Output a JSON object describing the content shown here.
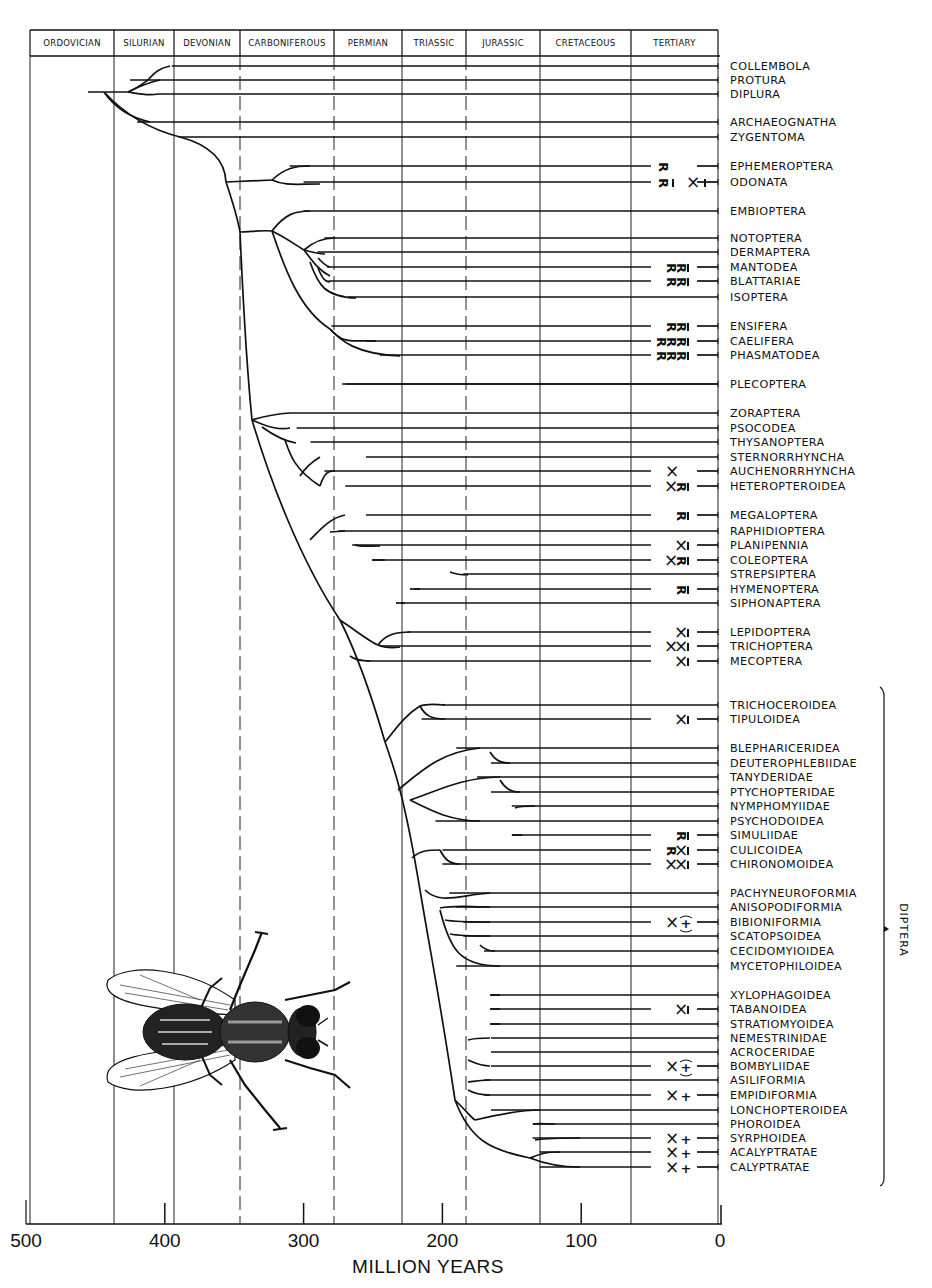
{
  "chart_data": {
    "type": "phylogenetic-tree",
    "title": "",
    "xlabel": "MILLION YEARS",
    "xlim": [
      500,
      0
    ],
    "x_ticks": [
      500,
      400,
      300,
      200,
      100,
      0
    ],
    "periods": [
      {
        "name": "ORDOVICIAN",
        "start": 500,
        "end": 440
      },
      {
        "name": "SILURIAN",
        "start": 440,
        "end": 395
      },
      {
        "name": "DEVONIAN",
        "start": 395,
        "end": 345
      },
      {
        "name": "CARBONIFEROUS",
        "start": 345,
        "end": 280
      },
      {
        "name": "PERMIAN",
        "start": 280,
        "end": 230
      },
      {
        "name": "TRIASSIC",
        "start": 230,
        "end": 185
      },
      {
        "name": "JURASSIC",
        "start": 185,
        "end": 130
      },
      {
        "name": "CRETACEOUS",
        "start": 130,
        "end": 65
      },
      {
        "name": "TERTIARY",
        "start": 65,
        "end": 0
      }
    ],
    "taxa": [
      {
        "name": "COLLEMBOLA",
        "y": 66,
        "origin_myr": 395,
        "markers": ""
      },
      {
        "name": "PROTURA",
        "y": 80,
        "origin_myr": 425,
        "markers": ""
      },
      {
        "name": "DIPLURA",
        "y": 94,
        "origin_myr": 405,
        "markers": ""
      },
      {
        "name": "ARCHAEOGNATHA",
        "y": 122,
        "origin_myr": 420,
        "markers": ""
      },
      {
        "name": "ZYGENTOMA",
        "y": 137,
        "origin_myr": 390,
        "markers": ""
      },
      {
        "name": "EPHEMEROPTERA",
        "y": 166,
        "origin_myr": 310,
        "markers": "R"
      },
      {
        "name": "ODONATA",
        "y": 182,
        "origin_myr": 300,
        "markers": "R X"
      },
      {
        "name": "EMBIOPTERA",
        "y": 211,
        "origin_myr": 300,
        "markers": ""
      },
      {
        "name": "NOTOPTERA",
        "y": 238,
        "origin_myr": 285,
        "markers": ""
      },
      {
        "name": "DERMAPTERA",
        "y": 252,
        "origin_myr": 290,
        "markers": ""
      },
      {
        "name": "MANTODEA",
        "y": 267,
        "origin_myr": 283,
        "markers": "RR"
      },
      {
        "name": "BLATTARIAE",
        "y": 281,
        "origin_myr": 282,
        "markers": "RR"
      },
      {
        "name": "ISOPTERA",
        "y": 297,
        "origin_myr": 268,
        "markers": ""
      },
      {
        "name": "ENSIFERA",
        "y": 326,
        "origin_myr": 280,
        "markers": "RR"
      },
      {
        "name": "CAELIFERA",
        "y": 341,
        "origin_myr": 255,
        "markers": "RRR"
      },
      {
        "name": "PHASMATODEA",
        "y": 355,
        "origin_myr": 245,
        "markers": "RRR"
      },
      {
        "name": "PLECOPTERA",
        "y": 384,
        "origin_myr": 270,
        "markers": ""
      },
      {
        "name": "ZORAPTERA",
        "y": 413,
        "origin_myr": 310,
        "markers": ""
      },
      {
        "name": "PSOCODEA",
        "y": 428,
        "origin_myr": 305,
        "markers": ""
      },
      {
        "name": "THYSANOPTERA",
        "y": 442,
        "origin_myr": 295,
        "markers": ""
      },
      {
        "name": "STERNORRHYNCHA",
        "y": 457,
        "origin_myr": 255,
        "markers": ""
      },
      {
        "name": "AUCHENORRHYNCHA",
        "y": 471,
        "origin_myr": 285,
        "markers": "X"
      },
      {
        "name": "HETEROPTEROIDEA",
        "y": 486,
        "origin_myr": 270,
        "markers": "XR"
      },
      {
        "name": "MEGALOPTERA",
        "y": 515,
        "origin_myr": 255,
        "markers": "R"
      },
      {
        "name": "RAPHIDIOPTERA",
        "y": 531,
        "origin_myr": 275,
        "markers": ""
      },
      {
        "name": "PLANIPENNIA",
        "y": 545,
        "origin_myr": 265,
        "markers": "X"
      },
      {
        "name": "COLEOPTERA",
        "y": 560,
        "origin_myr": 250,
        "markers": "XR"
      },
      {
        "name": "STREPSIPTERA",
        "y": 574,
        "origin_myr": 185,
        "markers": ""
      },
      {
        "name": "HYMENOPTERA",
        "y": 589,
        "origin_myr": 220,
        "markers": "R"
      },
      {
        "name": "SIPHONAPTERA",
        "y": 603,
        "origin_myr": 230,
        "markers": ""
      },
      {
        "name": "LEPIDOPTERA",
        "y": 632,
        "origin_myr": 225,
        "markers": "X"
      },
      {
        "name": "TRICHOPTERA",
        "y": 646,
        "origin_myr": 245,
        "markers": "XX"
      },
      {
        "name": "MECOPTERA",
        "y": 661,
        "origin_myr": 255,
        "markers": "X"
      },
      {
        "name": "TRICHOCEROIDEA",
        "y": 705,
        "origin_myr": 200,
        "markers": "",
        "group": "DIPTERA"
      },
      {
        "name": "TIPULOIDEA",
        "y": 719,
        "origin_myr": 215,
        "markers": "X",
        "group": "DIPTERA"
      },
      {
        "name": "BLEPHARICERIDEA",
        "y": 748,
        "origin_myr": 190,
        "markers": "",
        "group": "DIPTERA"
      },
      {
        "name": "DEUTEROPHLEBIIDAE",
        "y": 763,
        "origin_myr": 165,
        "markers": "",
        "group": "DIPTERA"
      },
      {
        "name": "TANYDERIDAE",
        "y": 777,
        "origin_myr": 175,
        "markers": "",
        "group": "DIPTERA"
      },
      {
        "name": "PTYCHOPTERIDAE",
        "y": 792,
        "origin_myr": 165,
        "markers": "",
        "group": "DIPTERA"
      },
      {
        "name": "NYMPHOMYIIDAE",
        "y": 806,
        "origin_myr": 150,
        "markers": "",
        "group": "DIPTERA"
      },
      {
        "name": "PSYCHODOIDEA",
        "y": 821,
        "origin_myr": 205,
        "markers": "",
        "group": "DIPTERA"
      },
      {
        "name": "SIMULIIDAE",
        "y": 835,
        "origin_myr": 150,
        "markers": "R",
        "group": "DIPTERA"
      },
      {
        "name": "CULICOIDEA",
        "y": 850,
        "origin_myr": 200,
        "markers": "RX",
        "group": "DIPTERA"
      },
      {
        "name": "CHIRONOMOIDEA",
        "y": 864,
        "origin_myr": 200,
        "markers": "XX",
        "group": "DIPTERA"
      },
      {
        "name": "PACHYNEUROFORMIA",
        "y": 893,
        "origin_myr": 195,
        "markers": "",
        "group": "DIPTERA"
      },
      {
        "name": "ANISOPODIFORMIA",
        "y": 907,
        "origin_myr": 190,
        "markers": "",
        "group": "DIPTERA"
      },
      {
        "name": "BIBIONIFORMIA",
        "y": 922,
        "origin_myr": 185,
        "markers": "X(+)",
        "group": "DIPTERA"
      },
      {
        "name": "SCATOPSOIDEA",
        "y": 936,
        "origin_myr": 185,
        "markers": "",
        "group": "DIPTERA"
      },
      {
        "name": "CECIDOMYIOIDEA",
        "y": 951,
        "origin_myr": 170,
        "markers": "",
        "group": "DIPTERA"
      },
      {
        "name": "MYCETOPHILOIDEA",
        "y": 966,
        "origin_myr": 190,
        "markers": "",
        "group": "DIPTERA"
      },
      {
        "name": "XYLOPHAGOIDEA",
        "y": 995,
        "origin_myr": 165,
        "markers": "",
        "group": "DIPTERA"
      },
      {
        "name": "TABANOIDEA",
        "y": 1009,
        "origin_myr": 165,
        "markers": "X",
        "group": "DIPTERA"
      },
      {
        "name": "STRATIOMYOIDEA",
        "y": 1024,
        "origin_myr": 165,
        "markers": "",
        "group": "DIPTERA"
      },
      {
        "name": "NEMESTRINIDAE",
        "y": 1038,
        "origin_myr": 165,
        "markers": "",
        "group": "DIPTERA"
      },
      {
        "name": "ACROCERIDAE",
        "y": 1052,
        "origin_myr": 165,
        "markers": "",
        "group": "DIPTERA"
      },
      {
        "name": "BOMBYLIIDAE",
        "y": 1066,
        "origin_myr": 165,
        "markers": "X(+)",
        "group": "DIPTERA"
      },
      {
        "name": "ASILIFORMIA",
        "y": 1080,
        "origin_myr": 170,
        "markers": "",
        "group": "DIPTERA"
      },
      {
        "name": "EMPIDIFORMIA",
        "y": 1095,
        "origin_myr": 170,
        "markers": "X+",
        "group": "DIPTERA"
      },
      {
        "name": "LONCHOPTEROIDEA",
        "y": 1110,
        "origin_myr": 165,
        "markers": "",
        "group": "DIPTERA"
      },
      {
        "name": "PHOROIDEA",
        "y": 1124,
        "origin_myr": 135,
        "markers": "",
        "group": "DIPTERA"
      },
      {
        "name": "SYRPHOIDEA",
        "y": 1138,
        "origin_myr": 135,
        "markers": "X+",
        "group": "DIPTERA"
      },
      {
        "name": "ACALYPTRATAE",
        "y": 1152,
        "origin_myr": 130,
        "markers": "X+",
        "group": "DIPTERA"
      },
      {
        "name": "CALYPTRATAE",
        "y": 1167,
        "origin_myr": 130,
        "markers": "X+",
        "group": "DIPTERA"
      }
    ],
    "groups": [
      {
        "name": "DIPTERA",
        "from": "TRICHOCEROIDEA",
        "to": "CALYPTRATAE"
      }
    ],
    "illustration": "house-fly (Diptera) dorsal view"
  },
  "header": {
    "periods": [
      "ORDOVICIAN",
      "SILURIAN",
      "DEVONIAN",
      "CARBONIFEROUS",
      "PERMIAN",
      "TRIASSIC",
      "JURASSIC",
      "CRETACEOUS",
      "TERTIARY"
    ]
  },
  "axis": {
    "title": "MILLION YEARS",
    "ticks": [
      "500",
      "400",
      "300",
      "200",
      "100",
      "0"
    ]
  },
  "bracket": {
    "label": "DIPTERA"
  },
  "colors": {
    "ink": "#111111",
    "background": "#ffffff"
  }
}
